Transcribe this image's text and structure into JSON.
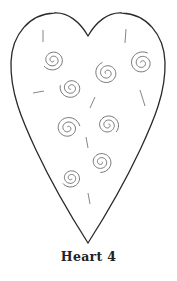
{
  "caption": "Heart 4",
  "colors": {
    "outline": "#2a2a2a",
    "spiral": "#666666",
    "dash": "#777777",
    "background": "#ffffff"
  },
  "heart": {
    "cleft": [
      88,
      36
    ],
    "bottom_tip": [
      88,
      243
    ]
  },
  "spirals": [
    {
      "cx": 53,
      "cy": 60,
      "r": 11
    },
    {
      "cx": 71,
      "cy": 88,
      "r": 11
    },
    {
      "cx": 107,
      "cy": 73,
      "r": 12
    },
    {
      "cx": 142,
      "cy": 63,
      "r": 12
    },
    {
      "cx": 68,
      "cy": 128,
      "r": 12
    },
    {
      "cx": 108,
      "cy": 125,
      "r": 11
    },
    {
      "cx": 101,
      "cy": 162,
      "r": 11
    },
    {
      "cx": 71,
      "cy": 178,
      "r": 10
    }
  ],
  "dashes": [
    {
      "x1": 43,
      "y1": 30,
      "x2": 43,
      "y2": 42
    },
    {
      "x1": 126,
      "y1": 29,
      "x2": 125,
      "y2": 43
    },
    {
      "x1": 33,
      "y1": 93,
      "x2": 44,
      "y2": 91
    },
    {
      "x1": 95,
      "y1": 97,
      "x2": 90,
      "y2": 108
    },
    {
      "x1": 140,
      "y1": 90,
      "x2": 145,
      "y2": 106
    },
    {
      "x1": 86,
      "y1": 137,
      "x2": 88,
      "y2": 148
    },
    {
      "x1": 88,
      "y1": 193,
      "x2": 90,
      "y2": 204
    }
  ]
}
